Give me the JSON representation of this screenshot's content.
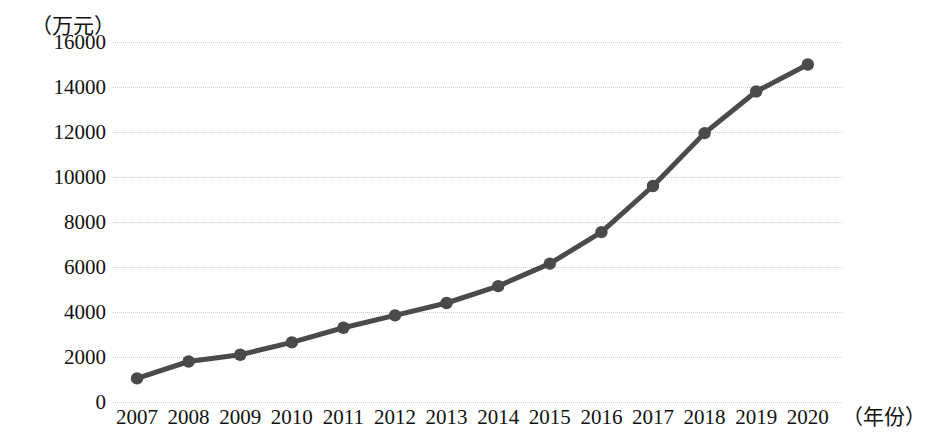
{
  "chart_data": {
    "type": "line",
    "title": "",
    "xlabel": "（年份）",
    "ylabel": "（万元）",
    "categories": [
      "2007",
      "2008",
      "2009",
      "2010",
      "2011",
      "2012",
      "2013",
      "2014",
      "2015",
      "2016",
      "2017",
      "2018",
      "2019",
      "2020"
    ],
    "values": [
      1050,
      1800,
      2100,
      2650,
      3300,
      3850,
      4400,
      5150,
      6150,
      7550,
      9600,
      11950,
      13800,
      15000
    ],
    "series": [
      {
        "name": "",
        "values": [
          1050,
          1800,
          2100,
          2650,
          3300,
          3850,
          4400,
          5150,
          6150,
          7550,
          9600,
          11950,
          13800,
          15000
        ]
      }
    ],
    "ylim": [
      0,
      16000
    ],
    "yticks": [
      0,
      2000,
      4000,
      6000,
      8000,
      10000,
      12000,
      14000,
      16000
    ],
    "ytick_labels": [
      "0",
      "2000",
      "4000",
      "6000",
      "8000",
      "10000",
      "12000",
      "14000",
      "16000"
    ],
    "grid": "horizontal-dotted",
    "legend": "none",
    "line_color": "#4a4a4a",
    "marker_color": "#4a4a4a",
    "grid_color": "#c9c9cf",
    "background_color": "#ffffff"
  }
}
